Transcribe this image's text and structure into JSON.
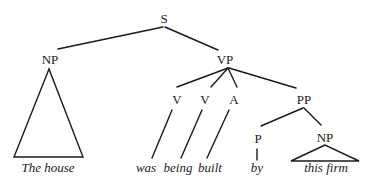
{
  "diagram": {
    "type": "syntax-tree",
    "nodes": {
      "s": "S",
      "np_subject": "NP",
      "vp": "VP",
      "v1": "V",
      "v2": "V",
      "a": "A",
      "pp": "PP",
      "p": "P",
      "np_object": "NP"
    },
    "leaves": {
      "subject": "The house",
      "was": "was",
      "being": "being",
      "built": "built",
      "by": "by",
      "object": "this firm"
    },
    "structure": "[S [NP The house] [VP [V was] [V being] [A built] [PP [P by] [NP this firm]]]]"
  }
}
